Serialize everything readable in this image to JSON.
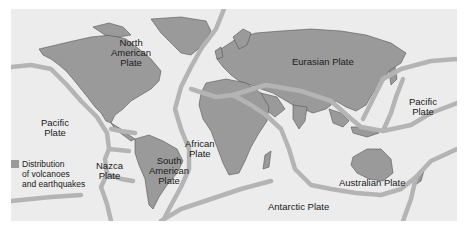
{
  "map": {
    "title": "Tectonic plates with distribution of volcanoes and earthquakes",
    "colors": {
      "ocean": "#ececec",
      "land": "#9a9a9a",
      "boundary": "#b4b4b4",
      "background": "#ffffff"
    },
    "plates": [
      {
        "id": "north-american",
        "lines": [
          "North",
          "American",
          "Plate"
        ]
      },
      {
        "id": "eurasian",
        "lines": [
          "Eurasian Plate"
        ]
      },
      {
        "id": "pacific-west",
        "lines": [
          "Pacific",
          "Plate"
        ]
      },
      {
        "id": "pacific-east",
        "lines": [
          "Pacific",
          "Plate"
        ]
      },
      {
        "id": "african",
        "lines": [
          "African",
          "Plate"
        ]
      },
      {
        "id": "nazca",
        "lines": [
          "Nazca",
          "Plate"
        ]
      },
      {
        "id": "south-american",
        "lines": [
          "South",
          "American",
          "Plate"
        ]
      },
      {
        "id": "australian",
        "lines": [
          "Australian Plate"
        ]
      },
      {
        "id": "antarctic",
        "lines": [
          "Antarctic Plate"
        ]
      }
    ],
    "legend": {
      "swatch_color": "#9a9a9a",
      "lines": [
        "Distribution",
        "of volcanoes",
        "and earthquakes"
      ]
    }
  }
}
